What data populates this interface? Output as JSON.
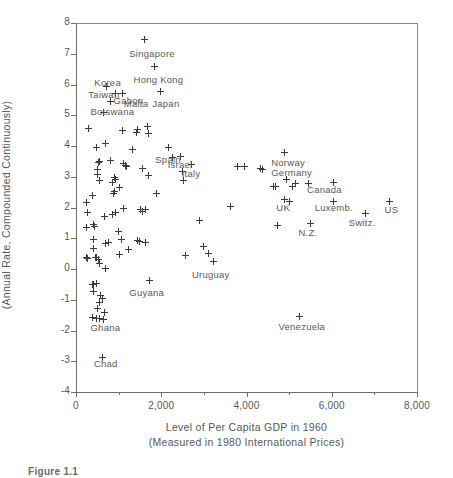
{
  "figure": {
    "caption": "Figure 1.1"
  },
  "chart_data": {
    "type": "scatter",
    "title": "",
    "xlabel": "Level of Per Capita GDP in 1960",
    "xlabel_line2": "(Measured in 1980 International Prices)",
    "ylabel": "Percentage Growth Rate of Per Capita GDP",
    "ylabel_line2": "(Annual Rate, Compounded Continuously)",
    "xlim": [
      0,
      8000
    ],
    "ylim": [
      -4,
      8
    ],
    "x_major_ticks": [
      0,
      2000,
      4000,
      6000,
      8000
    ],
    "x_minor_ticks": [
      1000,
      3000,
      5000,
      7000
    ],
    "x_tick_labels": [
      "0",
      "2,000",
      "4,000",
      "6,000",
      "8,000"
    ],
    "y_major_ticks": [
      -4,
      -3,
      -2,
      -1,
      0,
      1,
      2,
      3,
      4,
      5,
      6,
      7,
      8
    ],
    "y_tick_labels": [
      "-4",
      "-3",
      "-2",
      "-1",
      "0",
      "1",
      "2",
      "3",
      "4",
      "5",
      "6",
      "7",
      "8"
    ],
    "grid": false,
    "legend": "none",
    "marker": "plus",
    "labeled_points": [
      {
        "label": "Singapore",
        "x": 1600,
        "y": 7.45,
        "lx": 1250,
        "ly": 7.0
      },
      {
        "label": "Hong Kong",
        "x": 1840,
        "y": 6.6,
        "lx": 1350,
        "ly": 6.15
      },
      {
        "label": "Korea",
        "x": 720,
        "y": 5.95,
        "lx": 430,
        "ly": 6.05
      },
      {
        "label": "Taiwan",
        "x": 930,
        "y": 5.72,
        "lx": 290,
        "ly": 5.65
      },
      {
        "label": "Malta",
        "x": 1090,
        "y": 5.72,
        "lx": 1120,
        "ly": 5.35
      },
      {
        "label": "Japan",
        "x": 1980,
        "y": 5.78,
        "lx": 1790,
        "ly": 5.38
      },
      {
        "label": "Gabon",
        "x": 820,
        "y": 5.45,
        "lx": 880,
        "ly": 5.45
      },
      {
        "label": "Botswana",
        "x": 640,
        "y": 5.1,
        "lx": 340,
        "ly": 5.1
      },
      {
        "label": "Spain",
        "x": 2160,
        "y": 3.95,
        "lx": 1860,
        "ly": 3.55
      },
      {
        "label": "Israel",
        "x": 2440,
        "y": 3.65,
        "lx": 2150,
        "ly": 3.38
      },
      {
        "label": "Italy",
        "x": 2700,
        "y": 3.4,
        "lx": 2480,
        "ly": 3.08
      },
      {
        "label": "Norway",
        "x": 4880,
        "y": 3.78,
        "lx": 4580,
        "ly": 3.45
      },
      {
        "label": "Germany",
        "x": 4950,
        "y": 2.92,
        "lx": 4580,
        "ly": 3.12
      },
      {
        "label": "Canada",
        "x": 5450,
        "y": 2.78,
        "lx": 5420,
        "ly": 2.58
      },
      {
        "label": "UK",
        "x": 4900,
        "y": 2.25,
        "lx": 4700,
        "ly": 2.0
      },
      {
        "label": "Luxemb.",
        "x": 6050,
        "y": 2.18,
        "lx": 5600,
        "ly": 1.98
      },
      {
        "label": "Switz.",
        "x": 6800,
        "y": 1.82,
        "lx": 6400,
        "ly": 1.48
      },
      {
        "label": "US",
        "x": 7350,
        "y": 2.18,
        "lx": 7240,
        "ly": 1.92
      },
      {
        "label": "N.Z.",
        "x": 5500,
        "y": 1.48,
        "lx": 5220,
        "ly": 1.18
      },
      {
        "label": "Uruguay",
        "x": 3230,
        "y": 0.25,
        "lx": 2720,
        "ly": -0.18
      },
      {
        "label": "Guyana",
        "x": 1720,
        "y": -0.38,
        "lx": 1250,
        "ly": -0.78
      },
      {
        "label": "Venezuela",
        "x": 5250,
        "y": -1.55,
        "lx": 4750,
        "ly": -1.9
      },
      {
        "label": "Ghana",
        "x": 560,
        "y": -1.62,
        "lx": 340,
        "ly": -1.92
      },
      {
        "label": "Chad",
        "x": 610,
        "y": -2.88,
        "lx": 420,
        "ly": -3.1
      }
    ],
    "unlabeled_points": [
      {
        "x": 1450,
        "y": 4.55
      },
      {
        "x": 1680,
        "y": 4.62
      },
      {
        "x": 1700,
        "y": 4.42
      },
      {
        "x": 1080,
        "y": 4.52
      },
      {
        "x": 1430,
        "y": 4.45
      },
      {
        "x": 300,
        "y": 4.58
      },
      {
        "x": 700,
        "y": 4.08
      },
      {
        "x": 480,
        "y": 3.95
      },
      {
        "x": 1330,
        "y": 3.88
      },
      {
        "x": 560,
        "y": 3.5
      },
      {
        "x": 520,
        "y": 3.45
      },
      {
        "x": 800,
        "y": 3.52
      },
      {
        "x": 1110,
        "y": 3.42
      },
      {
        "x": 1150,
        "y": 3.38
      },
      {
        "x": 1180,
        "y": 3.32
      },
      {
        "x": 1560,
        "y": 3.28
      },
      {
        "x": 500,
        "y": 3.22
      },
      {
        "x": 510,
        "y": 3.08
      },
      {
        "x": 1710,
        "y": 3.05
      },
      {
        "x": 900,
        "y": 2.98
      },
      {
        "x": 930,
        "y": 2.92
      },
      {
        "x": 540,
        "y": 2.88
      },
      {
        "x": 2520,
        "y": 2.88
      },
      {
        "x": 860,
        "y": 2.8
      },
      {
        "x": 1030,
        "y": 2.65
      },
      {
        "x": 900,
        "y": 2.52
      },
      {
        "x": 870,
        "y": 2.45
      },
      {
        "x": 1880,
        "y": 2.45
      },
      {
        "x": 380,
        "y": 2.4
      },
      {
        "x": 250,
        "y": 2.15
      },
      {
        "x": 3620,
        "y": 2.02
      },
      {
        "x": 1120,
        "y": 1.98
      },
      {
        "x": 1510,
        "y": 1.92
      },
      {
        "x": 1620,
        "y": 1.92
      },
      {
        "x": 1550,
        "y": 1.88
      },
      {
        "x": 270,
        "y": 1.85
      },
      {
        "x": 920,
        "y": 1.83
      },
      {
        "x": 850,
        "y": 1.78
      },
      {
        "x": 660,
        "y": 1.72
      },
      {
        "x": 2900,
        "y": 1.58
      },
      {
        "x": 4720,
        "y": 1.4
      },
      {
        "x": 240,
        "y": 1.35
      },
      {
        "x": 400,
        "y": 1.45
      },
      {
        "x": 430,
        "y": 1.38
      },
      {
        "x": 1000,
        "y": 1.22
      },
      {
        "x": 1060,
        "y": 0.95
      },
      {
        "x": 1450,
        "y": 0.92
      },
      {
        "x": 1490,
        "y": 0.88
      },
      {
        "x": 1620,
        "y": 0.85
      },
      {
        "x": 760,
        "y": 0.85
      },
      {
        "x": 700,
        "y": 0.82
      },
      {
        "x": 410,
        "y": 0.95
      },
      {
        "x": 1230,
        "y": 0.62
      },
      {
        "x": 2980,
        "y": 0.72
      },
      {
        "x": 3100,
        "y": 0.52
      },
      {
        "x": 2560,
        "y": 0.45
      },
      {
        "x": 1020,
        "y": 0.48
      },
      {
        "x": 420,
        "y": 0.68
      },
      {
        "x": 250,
        "y": 0.38
      },
      {
        "x": 280,
        "y": 0.35
      },
      {
        "x": 450,
        "y": 0.38
      },
      {
        "x": 470,
        "y": 0.36
      },
      {
        "x": 520,
        "y": 0.32
      },
      {
        "x": 560,
        "y": 0.18
      },
      {
        "x": 700,
        "y": 0.02
      },
      {
        "x": 380,
        "y": -0.52
      },
      {
        "x": 420,
        "y": -0.5
      },
      {
        "x": 470,
        "y": -0.48
      },
      {
        "x": 400,
        "y": -0.72
      },
      {
        "x": 580,
        "y": -0.85
      },
      {
        "x": 620,
        "y": -0.95
      },
      {
        "x": 560,
        "y": -1.1
      },
      {
        "x": 500,
        "y": -1.3
      },
      {
        "x": 680,
        "y": -1.42
      },
      {
        "x": 380,
        "y": -1.58
      },
      {
        "x": 480,
        "y": -1.62
      },
      {
        "x": 650,
        "y": -1.65
      },
      {
        "x": 3950,
        "y": 3.32
      },
      {
        "x": 3780,
        "y": 3.32
      },
      {
        "x": 4330,
        "y": 3.28
      },
      {
        "x": 4380,
        "y": 3.25
      },
      {
        "x": 4640,
        "y": 2.68
      },
      {
        "x": 4680,
        "y": 2.68
      },
      {
        "x": 5150,
        "y": 2.78
      },
      {
        "x": 6050,
        "y": 2.82
      },
      {
        "x": 5080,
        "y": 2.68
      },
      {
        "x": 5000,
        "y": 2.2
      },
      {
        "x": 2260,
        "y": 3.62
      },
      {
        "x": 2500,
        "y": 3.18
      }
    ]
  }
}
